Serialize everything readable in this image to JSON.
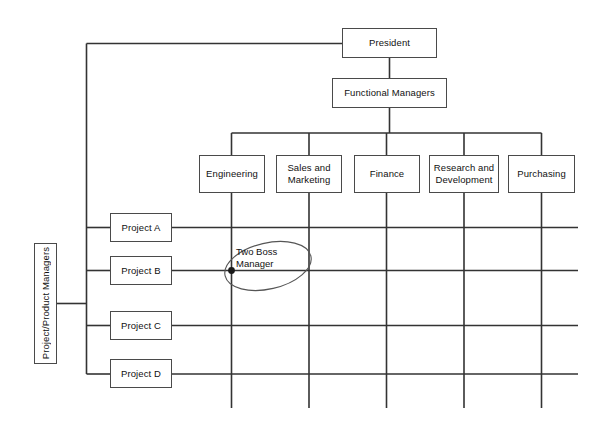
{
  "diagram": {
    "background_color": "#ffffff",
    "line_color": "#333333",
    "box_border_color": "#4a4a4a",
    "text_color": "#111111"
  },
  "top": {
    "president": "President",
    "functional_managers": "Functional Managers"
  },
  "functions": [
    {
      "label": "Engineering",
      "lines": [
        "Engineering"
      ]
    },
    {
      "label": "Sales and Marketing",
      "lines": [
        "Sales and",
        "Marketing"
      ]
    },
    {
      "label": "Finance",
      "lines": [
        "Finance"
      ]
    },
    {
      "label": "Research and Development",
      "lines": [
        "Research and",
        "Development"
      ]
    },
    {
      "label": "Purchasing",
      "lines": [
        "Purchasing"
      ]
    }
  ],
  "projects": [
    {
      "label": "Project A"
    },
    {
      "label": "Project B"
    },
    {
      "label": "Project C"
    },
    {
      "label": "Project D"
    }
  ],
  "side_label": {
    "text": "Project/Product Managers"
  },
  "annotation": {
    "lines": [
      "Two Boss",
      "Manager"
    ],
    "line1": "Two Boss",
    "line2": "Manager"
  }
}
